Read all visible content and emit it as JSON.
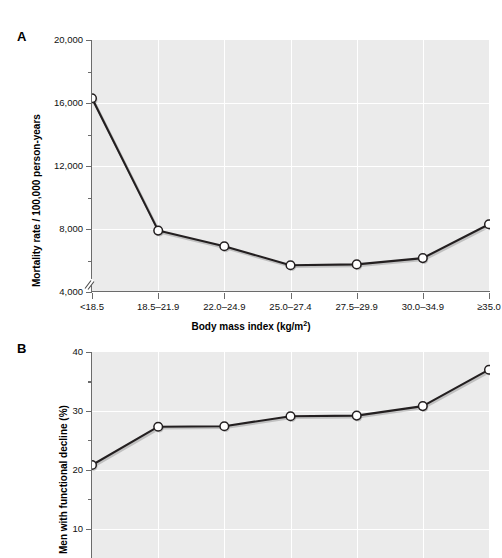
{
  "figure": {
    "panels": [
      {
        "id": "A",
        "label": "A",
        "ylabel": "Mortality rate / 100,000 person-years",
        "xlabel_main": "Body mass index (kg/m",
        "xlabel_sup": "2",
        "xlabel_tail": ")"
      },
      {
        "id": "B",
        "label": "B",
        "ylabel": "Men with functional decline (%)"
      }
    ],
    "colors": {
      "plot_background": "#ebebeb",
      "gridline": "#ffffff",
      "axis": "#6b6b6b",
      "line": "#231f20",
      "marker_fill": "#ffffff",
      "marker_stroke": "#231f20",
      "text": "#111111"
    }
  },
  "chart_data": [
    {
      "type": "line",
      "title": "A",
      "xlabel": "Body mass index (kg/m2)",
      "ylabel": "Mortality rate / 100,000 person-years",
      "categories": [
        "<18.5",
        "18.5–21.9",
        "22.0–24.9",
        "25.0–27.4",
        "27.5–29.9",
        "30.0–34.9",
        "≥35.0"
      ],
      "values": [
        16300,
        7900,
        6900,
        5700,
        5750,
        6150,
        8300
      ],
      "ytick_labels": [
        "20,000",
        "16,000",
        "12,000",
        "8,000",
        "4,000"
      ],
      "ytick_values": [
        20000,
        16000,
        12000,
        8000,
        4000
      ],
      "yminor_values": [
        18000,
        14000,
        10000,
        6000
      ],
      "ylim": [
        4000,
        20000
      ],
      "grid": true,
      "axis_break": true,
      "legend": "none"
    },
    {
      "type": "line",
      "title": "B",
      "xlabel": "Body mass index (kg/m2)",
      "ylabel": "Men with functional decline (%)",
      "categories": [
        "<18.5",
        "18.5–21.9",
        "22.0–24.9",
        "25.0–27.4",
        "27.5–29.9",
        "30.0–34.9",
        "≥35.0"
      ],
      "values": [
        20.8,
        27.3,
        27.4,
        29.1,
        29.2,
        30.8,
        37.0
      ],
      "ytick_labels": [
        "40",
        "30",
        "20",
        "10"
      ],
      "ytick_values": [
        40,
        30,
        20,
        10
      ],
      "yminor_values": [
        35,
        25,
        15
      ],
      "ylim": [
        5,
        40
      ],
      "grid": true,
      "axis_break": false,
      "legend": "none",
      "cropped_at_bottom": true
    }
  ],
  "axis_a": {
    "yticks": [
      {
        "label": "20,000",
        "value": 20000
      },
      {
        "label": "16,000",
        "value": 16000
      },
      {
        "label": "12,000",
        "value": 12000
      },
      {
        "label": "8,000",
        "value": 8000
      },
      {
        "label": "4,000",
        "value": 4000
      }
    ],
    "xticks": [
      {
        "label": "<18.5"
      },
      {
        "label": "18.5–21.9"
      },
      {
        "label": "22.0–24.9"
      },
      {
        "label": "25.0–27.4"
      },
      {
        "label": "27.5–29.9"
      },
      {
        "label": "30.0–34.9"
      },
      {
        "label": "≥35.0"
      }
    ]
  },
  "axis_b": {
    "yticks": [
      {
        "label": "40",
        "value": 40
      },
      {
        "label": "30",
        "value": 30
      },
      {
        "label": "20",
        "value": 20
      },
      {
        "label": "10",
        "value": 10
      }
    ]
  }
}
